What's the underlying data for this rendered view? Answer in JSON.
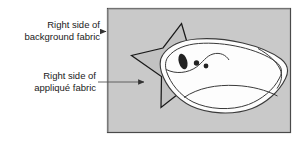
{
  "figure": {
    "background_color": "#ffffff"
  },
  "panel": {
    "name": "background-fabric-panel",
    "fill": "#c9c9c9",
    "border_color": "#4a4a4a",
    "x": 107,
    "y": 8,
    "width": 184,
    "height": 125
  },
  "callouts": [
    {
      "id": "background-fabric",
      "line1": "Right side of",
      "line2": "background fabric",
      "leader_target": "panel-left-edge"
    },
    {
      "id": "applique-fabric",
      "line1": "Right side of",
      "line2": "appliqué fabric",
      "leader_target": "star-shape"
    }
  ],
  "shapes": {
    "star": {
      "name": "applique-star-shape",
      "fill": "#c2c2c2",
      "stroke": "#1a1a1a",
      "points": 5
    },
    "fish": {
      "name": "fish-applique-shape",
      "fill": "#fdfdfd",
      "stroke": "#3a3a3a",
      "eye_fill": "#222222",
      "dot_fill": "#222222",
      "dot_count": 2
    }
  },
  "colors": {
    "ink": "#1a1a1a",
    "leader_line": "#555555",
    "panel_gray": "#c9c9c9",
    "star_gray": "#c2c2c2",
    "fish_white": "#fdfdfd"
  }
}
